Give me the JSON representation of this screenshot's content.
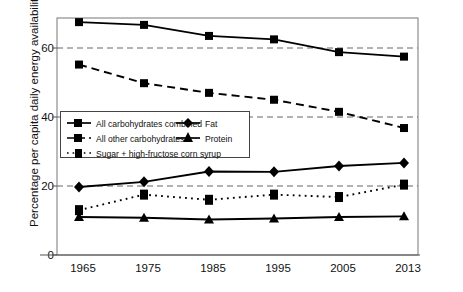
{
  "chart_data": {
    "type": "line",
    "title": "",
    "xlabel": "",
    "ylabel": "Percentage per capita daily energy availability",
    "categories": [
      "1965",
      "1975",
      "1985",
      "1995",
      "2005",
      "2013"
    ],
    "x": [
      1965,
      1975,
      1985,
      1995,
      2005,
      2013
    ],
    "ylim": [
      0,
      70
    ],
    "yticks": [
      0,
      20,
      40,
      60
    ],
    "ytick_labels": [
      "0",
      "20",
      "40",
      "60"
    ],
    "xlim": [
      1960,
      2018
    ],
    "grid": "horizontal dashed gridlines at 20, 40, 60",
    "legend_position": "inside middle-left",
    "series": [
      {
        "name": "All carbohydrates combined",
        "marker": "square",
        "line": "solid",
        "values": [
          67.5,
          66.7,
          63.5,
          62.5,
          58.8,
          57.5
        ]
      },
      {
        "name": "All other carbohydrates",
        "marker": "square",
        "line": "dashed",
        "values": [
          55.2,
          49.8,
          47.0,
          45.0,
          41.5,
          36.8
        ]
      },
      {
        "name": "Fat",
        "marker": "diamond",
        "line": "solid",
        "values": [
          19.7,
          21.2,
          24.2,
          24.1,
          25.8,
          26.7
        ]
      },
      {
        "name": "Protein",
        "marker": "triangle",
        "line": "solid",
        "values": [
          11.0,
          10.8,
          10.3,
          10.6,
          11.0,
          11.2
        ]
      },
      {
        "name": "Sugar + high-fructose corn syrup",
        "marker": "square",
        "line": "dotted",
        "values": [
          13.0,
          17.5,
          16.0,
          17.5,
          16.8,
          20.4
        ]
      }
    ]
  },
  "legend": {
    "items": [
      {
        "label": "All carbohydrates combined"
      },
      {
        "label": "Fat"
      },
      {
        "label": "All other carbohydrates"
      },
      {
        "label": "Protein"
      },
      {
        "label": "Sugar + high-fructose corn syrup"
      }
    ]
  },
  "colors": {
    "series": "#000000",
    "axis": "#555555",
    "grid": "#666666",
    "background": "#ffffff"
  }
}
